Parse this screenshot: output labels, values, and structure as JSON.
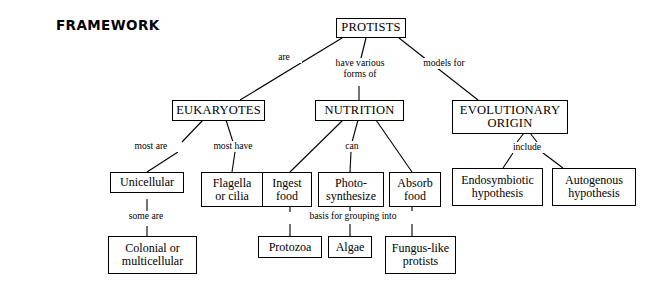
{
  "title": "FRAMEWORK",
  "diagram": {
    "type": "concept-map",
    "root": "PROTISTS",
    "nodes": [
      {
        "id": "protists",
        "label": "PROTISTS",
        "level": 0
      },
      {
        "id": "eukaryotes",
        "label": "EUKARYOTES",
        "level": 1
      },
      {
        "id": "nutrition",
        "label": "NUTRITION",
        "level": 1
      },
      {
        "id": "evolutionary-origin",
        "label": "EVOLUTIONARY\nORIGIN",
        "level": 1
      },
      {
        "id": "unicellular",
        "label": "Unicellular",
        "level": 2
      },
      {
        "id": "flagella-or-cilia",
        "label": "Flagella\nor cilia",
        "level": 2
      },
      {
        "id": "ingest-food",
        "label": "Ingest\nfood",
        "level": 2
      },
      {
        "id": "photosynthesize",
        "label": "Photo-\nsynthesize",
        "level": 2
      },
      {
        "id": "absorb-food",
        "label": "Absorb\nfood",
        "level": 2
      },
      {
        "id": "endosymbiotic-hypothesis",
        "label": "Endosymbiotic\nhypothesis",
        "level": 2
      },
      {
        "id": "autogenous-hypothesis",
        "label": "Autogenous\nhypothesis",
        "level": 2
      },
      {
        "id": "colonial-or-multicellular",
        "label": "Colonial or\nmulticellular",
        "level": 3
      },
      {
        "id": "protozoa",
        "label": "Protozoa",
        "level": 3
      },
      {
        "id": "algae",
        "label": "Algae",
        "level": 3
      },
      {
        "id": "fungus-like-protists",
        "label": "Fungus-like\nprotists",
        "level": 3
      }
    ],
    "edges": [
      {
        "from": "protists",
        "to": "eukaryotes",
        "label": "are"
      },
      {
        "from": "protists",
        "to": "nutrition",
        "label": "have various\nforms of"
      },
      {
        "from": "protists",
        "to": "evolutionary-origin",
        "label": "models for"
      },
      {
        "from": "eukaryotes",
        "to": "unicellular",
        "label": "most are"
      },
      {
        "from": "eukaryotes",
        "to": "flagella-or-cilia",
        "label": "most have"
      },
      {
        "from": "nutrition",
        "to": "ingest-food",
        "label": "can"
      },
      {
        "from": "nutrition",
        "to": "photosynthesize",
        "label": "can"
      },
      {
        "from": "nutrition",
        "to": "absorb-food",
        "label": "can"
      },
      {
        "from": "evolutionary-origin",
        "to": "endosymbiotic-hypothesis",
        "label": "include"
      },
      {
        "from": "evolutionary-origin",
        "to": "autogenous-hypothesis",
        "label": "include"
      },
      {
        "from": "unicellular",
        "to": "colonial-or-multicellular",
        "label": "some are"
      },
      {
        "from": "ingest-food",
        "to": "protozoa",
        "label": "basis for grouping into"
      },
      {
        "from": "photosynthesize",
        "to": "algae",
        "label": "basis for grouping into"
      },
      {
        "from": "absorb-food",
        "to": "fungus-like-protists",
        "label": "basis for grouping into"
      }
    ],
    "edge_labels": {
      "are": "are",
      "have_various_forms_of": "have various\nforms of",
      "models_for": "models for",
      "most_are": "most are",
      "most_have": "most have",
      "can": "can",
      "include": "include",
      "some_are": "some are",
      "basis_for_grouping_into": "basis for grouping into"
    },
    "colors": {
      "background": "#ffffff",
      "box_border": "#000000",
      "connector": "#000000",
      "text": "#000000"
    }
  }
}
